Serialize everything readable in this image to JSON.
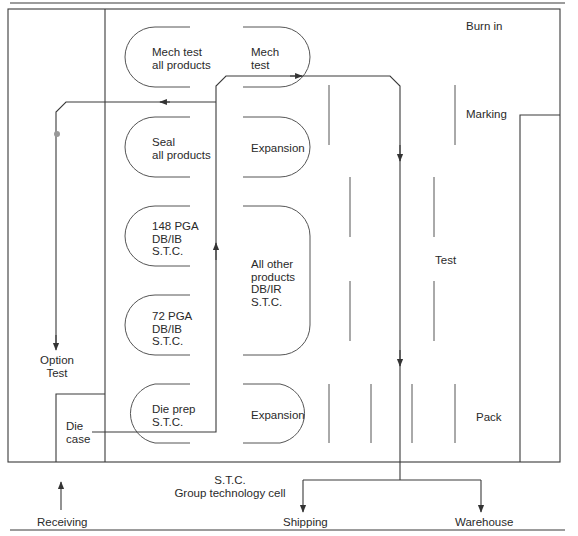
{
  "diagram": {
    "top_area": {
      "cells_left": [
        {
          "id": "mech-test-all",
          "label": "Mech test\nall products"
        },
        {
          "id": "seal-all",
          "label": "Seal\nall products"
        },
        {
          "id": "pga148",
          "label": "148 PGA\nDB/IB\nS.T.C."
        },
        {
          "id": "pga72",
          "label": "72 PGA\nDB/IB\nS.T.C."
        },
        {
          "id": "die-prep",
          "label": "Die prep\nS.T.C."
        }
      ],
      "cells_right": [
        {
          "id": "mech-test",
          "label": "Mech\ntest"
        },
        {
          "id": "expansion-top",
          "label": "Expansion"
        },
        {
          "id": "all-other",
          "label": "All other\nproducts\nDB/IR\nS.T.C."
        },
        {
          "id": "expansion-bottom",
          "label": "Expansion"
        }
      ],
      "zones": {
        "burn_in": "Burn in",
        "marking": "Marking",
        "test": "Test",
        "pack": "Pack",
        "option_test": "Option\nTest",
        "die_case": "Die\ncase"
      }
    },
    "bottom_area": {
      "caption": "S.T.C.\nGroup technology cell",
      "receiving": "Receiving",
      "shipping": "Shipping",
      "warehouse": "Warehouse"
    },
    "colors": {
      "line": "#3a3a3a",
      "background": "#ffffff",
      "text": "#2a2a2a"
    }
  }
}
